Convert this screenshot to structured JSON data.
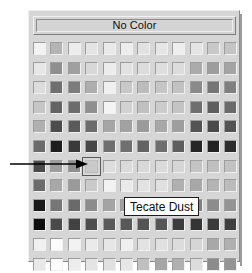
{
  "window": {
    "title": "Color Picker",
    "background": "#ffffff"
  },
  "panel": {
    "name": "color-picker-panel",
    "background": "#d6d6d6"
  },
  "no_color_button": {
    "label": "No Color",
    "enabled": true
  },
  "tooltip": {
    "label": "Tecate Dust",
    "visible": true,
    "background": "#ffffff",
    "border_color": "#1d1d1d"
  },
  "annotation": {
    "type": "arrow",
    "direction": "right",
    "color": "#000000",
    "points_to": "swatch-r7-c4"
  },
  "grid": {
    "columns": 12,
    "rows": 11,
    "cell_size": 15,
    "chip_size": 13,
    "selected": {
      "row": 7,
      "col": 4
    },
    "selected_color_name": "Tecate Dust",
    "swatches": [
      [
        "#f2f2f2",
        "#b4b4b4",
        "#ececec",
        "#e4e4e4",
        "#e9e9e9",
        "#ededed",
        "#e2e2e2",
        "#e6e6e6",
        "#eeeeee",
        "#e4e4e4",
        "#c8c8c8",
        "#c4c4c4"
      ],
      [
        "#e6e6e6",
        "#8f8f8f",
        "#a0a0a0",
        "#d8d8d8",
        "#ececec",
        "#e2e2e2",
        "#dcdcdc",
        "#dedede",
        "#dcdcdc",
        "#ababab",
        "#9d9d9d",
        "#a4a4a4"
      ],
      [
        "#dcdcdc",
        "#6f6f6f",
        "#7c7c7c",
        "#aeaeae",
        "#f0f0f0",
        "#c8c8c8",
        "#bcbcbc",
        "#c6c6c6",
        "#c2c2c2",
        "#8a8a8a",
        "#767676",
        "#808080"
      ],
      [
        "#c6c6c6",
        "#636363",
        "#6c6c6c",
        "#8f8f8f",
        "#f4f4f4",
        "#d2d2d2",
        "#c0c0c0",
        "#cccccc",
        "#c4c4c4",
        "#6e6e6e",
        "#5e5e5e",
        "#6a6a6a"
      ],
      [
        "#b0b0b0",
        "#4c4c4c",
        "#5a5a5a",
        "#6c6c6c",
        "#a6a6a6",
        "#a2a2a2",
        "#9a9a9a",
        "#a8a8a8",
        "#9e9e9e",
        "#545454",
        "#4a4a4a",
        "#525252"
      ],
      [
        "#6a6a6a",
        "#1d1d1d",
        "#3a3a3a",
        "#474747",
        "#6e6e6e",
        "#707070",
        "#646464",
        "#6e6e6e",
        "#5e5e5e",
        "#262626",
        "#232323",
        "#2c2c2c"
      ],
      [
        "#4a4a4a",
        "#9c9c9c",
        "#8e8e8e",
        "#c9c9c9",
        "#dcdcdc",
        "#dadada",
        "#d8d8d8",
        "#dadada",
        "#d6d6d6",
        "#c4c4c4",
        "#c0c0c0",
        "#c2c2c2"
      ],
      [
        "#6c6c6c",
        "#a8a8a8",
        "#9a9a9a",
        "#cacaca",
        "#f2f2f2",
        "#eaeaea",
        "#e2e2e2",
        "#e0e0e0",
        "#b0b0b0",
        "#a8a8a8",
        "#b4b4b4",
        "#bcbcbc"
      ],
      [
        "#1a1a1a",
        "#767676",
        "#6a6a6a",
        "#8c8c8c",
        "#a4a4a4",
        "#a0a0a0",
        "#9c9c9c",
        "#9a9a9a",
        "#8a8a8a",
        "#808080",
        "#8c8c8c",
        "#949494"
      ],
      [
        "#0d0d0d",
        "#4a4a4a",
        "#424242",
        "#4e4e4e",
        "#5a5a5a",
        "#585858",
        "#545454",
        "#565656",
        "#3c3c3c",
        "#343434",
        "#3a3a3a",
        "#404040"
      ],
      [
        "#f0f0f0",
        "#fbfbfb",
        "#f2f2f2",
        "#eaeaea",
        "#e6e6e6",
        "#efefef",
        "#e2e2e2",
        "#e0e0e0",
        "#dcdcdc",
        "#d6d6d6",
        "#a8a8a8",
        "#b0b0b0"
      ],
      [
        "#e8e8e8",
        "#fcfcfc",
        "#ededed",
        "#e4e4e4",
        "#e0e0e0",
        "#e6e6e6",
        "#c0c0c0",
        "#a6a6a6",
        "#b0b0b0",
        "#dcdcdc",
        "#8c8c8c",
        "#949494"
      ]
    ]
  }
}
